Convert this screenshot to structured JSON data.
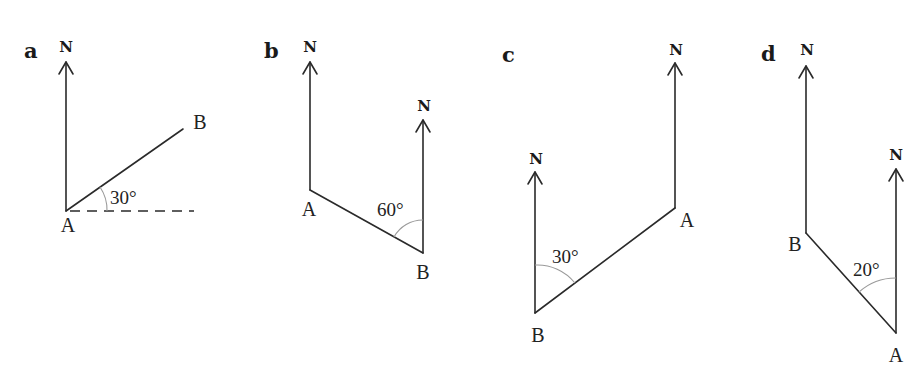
{
  "figure": {
    "panels": [
      {
        "letter": "a",
        "north_label": "N",
        "point_A": "A",
        "point_B": "B",
        "angle": "30°",
        "angle_reference": "east (dashed horizontal)"
      },
      {
        "letter": "b",
        "north_label_A": "N",
        "north_label_B": "N",
        "point_A": "A",
        "point_B": "B",
        "angle": "60°",
        "angle_reference": "north at B"
      },
      {
        "letter": "c",
        "north_label_A": "N",
        "north_label_B": "N",
        "point_A": "A",
        "point_B": "B",
        "angle": "30°",
        "angle_reference": "north at B"
      },
      {
        "letter": "d",
        "north_label_B": "N",
        "north_label_A": "N",
        "point_A": "A",
        "point_B": "B",
        "angle": "20°",
        "angle_reference": "north at A"
      }
    ]
  }
}
